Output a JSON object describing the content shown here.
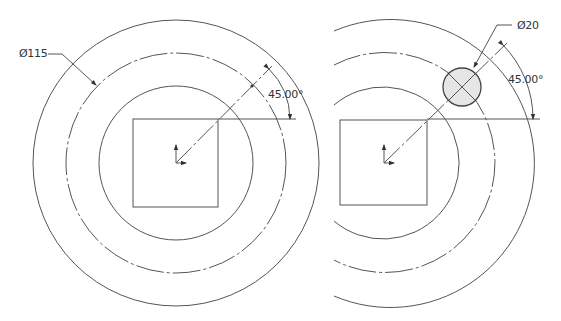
{
  "left_view": {
    "diameter_label": "Ø115",
    "angle_label": "45.00°"
  },
  "right_view": {
    "diameter_label": "Ø20",
    "angle_label": "45.00°"
  },
  "colors": {
    "line": "#555555",
    "hole_fill": "#e6e6e6"
  }
}
